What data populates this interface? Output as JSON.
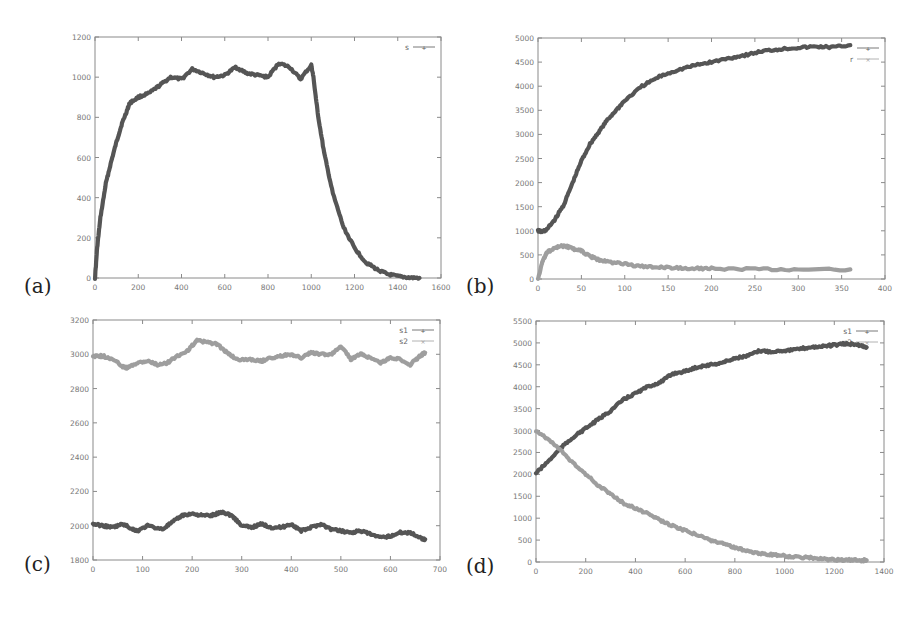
{
  "colors": {
    "dark": "#555555",
    "light": "#9e9e9e",
    "axis": "#8a8a8a"
  },
  "chart_data": [
    {
      "id": "a",
      "panel_label": "(a)",
      "type": "line",
      "box": [
        95,
        37,
        441,
        278
      ],
      "label_pos": [
        24,
        282
      ],
      "xlim": [
        0,
        1600
      ],
      "ylim": [
        0,
        1200
      ],
      "xticks": [
        0,
        200,
        400,
        600,
        800,
        1000,
        1200,
        1400,
        1600
      ],
      "yticks": [
        0,
        200,
        400,
        600,
        800,
        1000,
        1200
      ],
      "legend": [
        "s"
      ],
      "series": [
        {
          "name": "s",
          "color": "dark",
          "x": [
            0,
            10,
            25,
            50,
            75,
            100,
            125,
            150,
            160,
            200,
            250,
            300,
            350,
            400,
            450,
            500,
            550,
            600,
            650,
            700,
            750,
            800,
            850,
            900,
            950,
            1000,
            1010,
            1030,
            1060,
            1100,
            1150,
            1200,
            1250,
            1300,
            1350,
            1400,
            1450,
            1500
          ],
          "y": [
            0,
            150,
            300,
            470,
            580,
            680,
            770,
            840,
            870,
            900,
            920,
            960,
            1000,
            990,
            1040,
            1020,
            1000,
            1010,
            1050,
            1020,
            1010,
            1000,
            1070,
            1050,
            990,
            1060,
            1000,
            820,
            620,
            420,
            250,
            150,
            80,
            45,
            20,
            8,
            2,
            0
          ]
        }
      ]
    },
    {
      "id": "b",
      "panel_label": "(b)",
      "type": "line",
      "box": [
        538,
        38,
        885,
        279
      ],
      "label_pos": [
        466,
        282
      ],
      "xlim": [
        0,
        400
      ],
      "ylim": [
        0,
        5000
      ],
      "xticks": [
        0,
        50,
        100,
        150,
        200,
        250,
        300,
        350,
        400
      ],
      "yticks": [
        0,
        500,
        1000,
        1500,
        2000,
        2500,
        3000,
        3500,
        4000,
        4500,
        5000
      ],
      "legend": [
        "",
        "r"
      ],
      "series": [
        {
          "name": "s",
          "color": "dark",
          "x": [
            0,
            5,
            10,
            20,
            30,
            40,
            50,
            60,
            70,
            80,
            90,
            100,
            120,
            140,
            160,
            180,
            200,
            220,
            240,
            260,
            280,
            300,
            320,
            340,
            360
          ],
          "y": [
            1000,
            980,
            1020,
            1250,
            1550,
            2000,
            2450,
            2800,
            3050,
            3300,
            3500,
            3700,
            4000,
            4200,
            4330,
            4430,
            4500,
            4580,
            4650,
            4730,
            4770,
            4800,
            4820,
            4810,
            4850
          ]
        },
        {
          "name": "r",
          "color": "light",
          "x": [
            0,
            5,
            10,
            20,
            30,
            40,
            50,
            60,
            70,
            80,
            100,
            120,
            140,
            160,
            180,
            200,
            250,
            300,
            360
          ],
          "y": [
            0,
            350,
            550,
            650,
            690,
            630,
            580,
            470,
            400,
            360,
            310,
            260,
            240,
            230,
            220,
            220,
            200,
            195,
            200
          ]
        }
      ]
    },
    {
      "id": "c",
      "panel_label": "(c)",
      "type": "line",
      "box": [
        93,
        320,
        440,
        560
      ],
      "label_pos": [
        24,
        560
      ],
      "xlim": [
        0,
        700
      ],
      "ylim": [
        1800,
        3200
      ],
      "xticks": [
        0,
        100,
        200,
        300,
        400,
        500,
        600,
        700
      ],
      "yticks": [
        1800,
        2000,
        2200,
        2400,
        2600,
        2800,
        3000,
        3200
      ],
      "legend": [
        "s1",
        "s2"
      ],
      "series": [
        {
          "name": "s1",
          "color": "dark",
          "x": [
            0,
            20,
            40,
            60,
            80,
            90,
            110,
            140,
            160,
            180,
            200,
            220,
            240,
            260,
            280,
            300,
            320,
            340,
            360,
            380,
            400,
            420,
            440,
            460,
            480,
            500,
            520,
            540,
            560,
            580,
            600,
            620,
            640,
            660,
            670
          ],
          "y": [
            2010,
            2000,
            1990,
            2010,
            1980,
            1970,
            2000,
            1980,
            2020,
            2060,
            2070,
            2060,
            2060,
            2080,
            2060,
            2000,
            1990,
            2010,
            1990,
            1990,
            2010,
            1970,
            1990,
            2010,
            1980,
            1970,
            1960,
            1970,
            1950,
            1930,
            1940,
            1960,
            1960,
            1930,
            1920
          ]
        },
        {
          "name": "s2",
          "color": "light",
          "x": [
            0,
            20,
            40,
            60,
            70,
            90,
            110,
            130,
            150,
            170,
            190,
            210,
            230,
            250,
            270,
            290,
            320,
            340,
            360,
            380,
            400,
            420,
            440,
            460,
            480,
            500,
            520,
            540,
            560,
            580,
            600,
            620,
            640,
            660,
            670
          ],
          "y": [
            2990,
            2990,
            2970,
            2930,
            2920,
            2950,
            2960,
            2940,
            2950,
            2990,
            3020,
            3080,
            3070,
            3060,
            3010,
            2970,
            2970,
            2960,
            2980,
            2990,
            3000,
            2980,
            3010,
            3000,
            3000,
            3050,
            2970,
            3000,
            2980,
            2950,
            2980,
            2970,
            2940,
            2990,
            3010
          ]
        }
      ]
    },
    {
      "id": "d",
      "panel_label": "(d)",
      "type": "line",
      "box": [
        536,
        321,
        884,
        562
      ],
      "label_pos": [
        466,
        562
      ],
      "xlim": [
        0,
        1400
      ],
      "ylim": [
        0,
        5500
      ],
      "xticks": [
        0,
        200,
        400,
        600,
        800,
        1000,
        1200,
        1400
      ],
      "yticks": [
        0,
        500,
        1000,
        1500,
        2000,
        2500,
        3000,
        3500,
        4000,
        4500,
        5000,
        5500
      ],
      "legend": [
        "s1",
        "s2"
      ],
      "series": [
        {
          "name": "s1",
          "color": "dark",
          "x": [
            0,
            50,
            100,
            150,
            200,
            250,
            300,
            350,
            400,
            450,
            500,
            550,
            600,
            650,
            700,
            750,
            800,
            850,
            900,
            950,
            1000,
            1050,
            1100,
            1150,
            1200,
            1250,
            1300,
            1330
          ],
          "y": [
            2030,
            2300,
            2600,
            2850,
            3050,
            3250,
            3450,
            3700,
            3850,
            4000,
            4100,
            4300,
            4350,
            4450,
            4500,
            4550,
            4650,
            4700,
            4820,
            4800,
            4830,
            4850,
            4900,
            4920,
            4950,
            4980,
            4950,
            4900
          ]
        },
        {
          "name": "s2",
          "color": "light",
          "x": [
            0,
            50,
            100,
            150,
            200,
            250,
            300,
            350,
            400,
            450,
            500,
            550,
            600,
            650,
            700,
            750,
            800,
            850,
            900,
            950,
            1000,
            1050,
            1100,
            1150,
            1200,
            1250,
            1300,
            1330
          ],
          "y": [
            3000,
            2800,
            2550,
            2250,
            2000,
            1750,
            1550,
            1350,
            1220,
            1100,
            950,
            820,
            720,
            620,
            500,
            420,
            330,
            250,
            200,
            170,
            140,
            110,
            100,
            70,
            50,
            45,
            40,
            40
          ]
        }
      ]
    }
  ]
}
